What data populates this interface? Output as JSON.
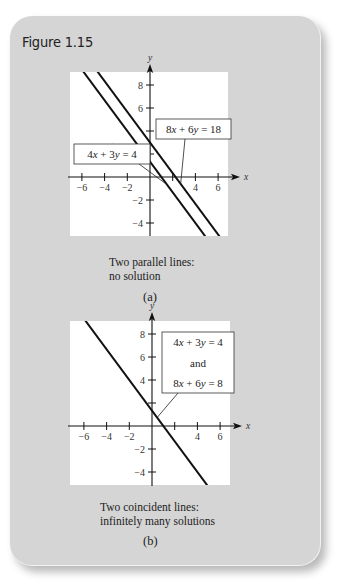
{
  "figure": {
    "title": "Figure 1.15"
  },
  "chart_data": [
    {
      "type": "line",
      "panel": "(a)",
      "caption_lines": [
        "Two parallel lines:",
        "no solution"
      ],
      "xlabel": "x",
      "ylabel": "y",
      "xlim": [
        -7,
        7
      ],
      "ylim": [
        -5,
        9
      ],
      "x_ticks": [
        -6,
        -4,
        -2,
        2,
        4,
        6
      ],
      "x_tick_labels": [
        "−6",
        "−4",
        "−2",
        "",
        "4",
        "6"
      ],
      "y_ticks": [
        -4,
        -2,
        2,
        4,
        6,
        8
      ],
      "y_tick_labels": [
        "−4",
        "−2",
        "",
        "",
        "6",
        "8"
      ],
      "grid": false,
      "series": [
        {
          "name": "4x + 3y = 4",
          "equation": {
            "a": 4,
            "b": 3,
            "c": 4
          },
          "label_lines": [
            "4x + 3y = 4"
          ],
          "label_position": "left"
        },
        {
          "name": "8x + 6y = 18",
          "equation": {
            "a": 8,
            "b": 6,
            "c": 18
          },
          "label_lines": [
            "8x + 6y = 18"
          ],
          "label_position": "top-right"
        }
      ]
    },
    {
      "type": "line",
      "panel": "(b)",
      "caption_lines": [
        "Two coincident lines:",
        "infinitely many solutions"
      ],
      "xlabel": "x",
      "ylabel": "y",
      "xlim": [
        -7,
        7
      ],
      "ylim": [
        -5,
        9
      ],
      "x_ticks": [
        -6,
        -4,
        -2,
        2,
        4,
        6
      ],
      "x_tick_labels": [
        "−6",
        "−4",
        "−2",
        "",
        "4",
        "6"
      ],
      "y_ticks": [
        -4,
        -2,
        2,
        4,
        6,
        8
      ],
      "y_tick_labels": [
        "−4",
        "−2",
        "",
        "4",
        "6",
        "8"
      ],
      "grid": false,
      "series": [
        {
          "name": "4x + 3y = 4 and 8x + 6y = 8",
          "equation": {
            "a": 4,
            "b": 3,
            "c": 4
          },
          "label_lines": [
            "4x + 3y = 4",
            "and",
            "8x + 6y = 8"
          ],
          "label_position": "top-right"
        }
      ]
    }
  ]
}
